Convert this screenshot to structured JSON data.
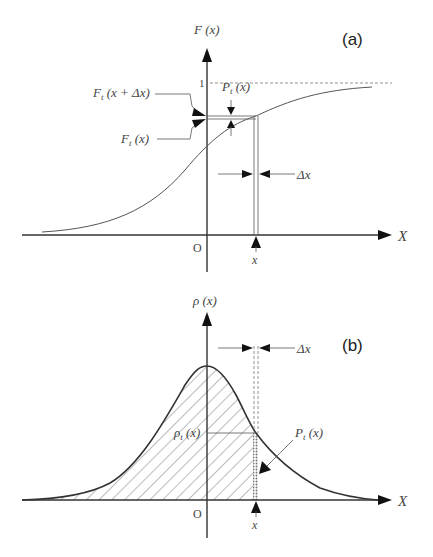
{
  "panel_a": {
    "label": "(a)",
    "y_axis_label": "F (x)",
    "x_axis_label": "X",
    "origin_label": "O",
    "one_tick_label": "1",
    "x_marker_label": "x",
    "delta_x_label": "Δx",
    "Ft_x_plus_dx_label": "F_t (x + Δx)",
    "Ft_x_plus_dx_main": "F",
    "Ft_x_plus_dx_sub": "t",
    "Ft_x_plus_dx_arg": " (x + Δx)",
    "Ft_x_main": "F",
    "Ft_x_sub": "t",
    "Ft_x_arg": " (x)",
    "Pt_main": "P",
    "Pt_sub": "t",
    "Pt_arg": " (x)"
  },
  "panel_b": {
    "label": "(b)",
    "y_axis_label": "ρ (x)",
    "x_axis_label": "X",
    "origin_label": "O",
    "x_marker_label": "x",
    "delta_x_label": "Δx",
    "rho_t_main": "ρ",
    "rho_t_sub": "t",
    "rho_t_arg": " (x)",
    "Pt_main": "P",
    "Pt_sub": "t",
    "Pt_arg": " (x)"
  }
}
